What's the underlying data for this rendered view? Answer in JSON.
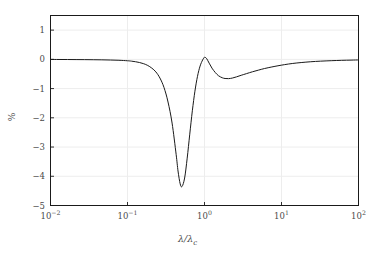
{
  "chart_data": {
    "type": "line",
    "title": "",
    "xlabel": "λ/λc",
    "ylabel": "%",
    "xscale": "log",
    "yscale": "linear",
    "xlim": [
      0.01,
      100
    ],
    "ylim": [
      -5,
      1.5
    ],
    "grid": true,
    "legend": null,
    "xticks": [
      {
        "value": 0.01,
        "mantissa": "10",
        "exponent": "-2"
      },
      {
        "value": 0.1,
        "mantissa": "10",
        "exponent": "-1"
      },
      {
        "value": 1,
        "mantissa": "10",
        "exponent": "0"
      },
      {
        "value": 10,
        "mantissa": "10",
        "exponent": "1"
      },
      {
        "value": 100,
        "mantissa": "10",
        "exponent": "2"
      }
    ],
    "yticks": [
      {
        "value": 1,
        "label": "1"
      },
      {
        "value": 0,
        "label": "0"
      },
      {
        "value": -1,
        "label": "−1"
      },
      {
        "value": -2,
        "label": "−2"
      },
      {
        "value": -3,
        "label": "−3"
      },
      {
        "value": -4,
        "label": "−4"
      },
      {
        "value": -5,
        "label": "−5"
      }
    ],
    "series": [
      {
        "name": "response",
        "color": "#1a1a1a",
        "linewidth": 1.0,
        "annotations": [
          {
            "label": "main resonance minimum",
            "x": 0.45,
            "y": -4.35
          },
          {
            "label": "local maximum",
            "x": 1.0,
            "y": 0.08
          },
          {
            "label": "secondary minimum",
            "x": 2.05,
            "y": -0.66
          }
        ],
        "x": [
          0.01,
          0.0129,
          0.0167,
          0.0215,
          0.0278,
          0.0359,
          0.0464,
          0.0599,
          0.0774,
          0.1,
          0.1129,
          0.1274,
          0.1438,
          0.1624,
          0.1833,
          0.2069,
          0.2336,
          0.2637,
          0.2976,
          0.336,
          0.3793,
          0.4281,
          0.4532,
          0.4833,
          0.511,
          0.552,
          0.596,
          0.6436,
          0.6952,
          0.7509,
          0.8111,
          0.8761,
          0.9462,
          1.0,
          1.0221,
          1.07,
          1.15,
          1.25,
          1.38,
          1.52,
          1.7,
          1.85,
          2.05,
          2.3,
          2.6,
          3.0,
          3.5,
          4.2,
          5.0,
          6.0,
          7.5,
          9.0,
          11.0,
          14.0,
          18.0,
          24.0,
          32.0,
          45.0,
          60.0,
          80.0,
          100.0
        ],
        "y": [
          -0.004,
          -0.005,
          -0.006,
          -0.008,
          -0.01,
          -0.013,
          -0.017,
          -0.023,
          -0.032,
          -0.048,
          -0.062,
          -0.082,
          -0.11,
          -0.15,
          -0.21,
          -0.3,
          -0.43,
          -0.64,
          -0.96,
          -1.46,
          -2.18,
          -3.25,
          -3.82,
          -4.26,
          -4.35,
          -4.06,
          -3.38,
          -2.56,
          -1.76,
          -1.09,
          -0.58,
          -0.23,
          -0.02,
          0.075,
          0.07,
          0.02,
          -0.13,
          -0.3,
          -0.45,
          -0.56,
          -0.63,
          -0.655,
          -0.66,
          -0.64,
          -0.6,
          -0.545,
          -0.49,
          -0.425,
          -0.37,
          -0.315,
          -0.26,
          -0.22,
          -0.18,
          -0.14,
          -0.11,
          -0.082,
          -0.062,
          -0.045,
          -0.034,
          -0.026,
          -0.02
        ]
      }
    ]
  },
  "axes": {
    "frame_color": "#1a1a1a",
    "grid_color": "#ededed",
    "background": "#ffffff"
  }
}
